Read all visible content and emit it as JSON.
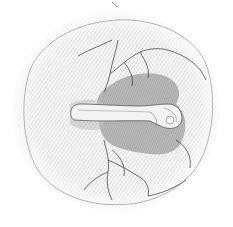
{
  "image": {
    "kind": "engraved scientific illustration",
    "subject": "embryo lying on a circular etched disc with branching vessels",
    "caption": "",
    "colors": {
      "paper": "#ffffff",
      "hatch_light": "#cfcfcf",
      "hatch_mid": "#b5b5b5",
      "shield_dark": "#9a9a9a",
      "vessel_line": "#4a4a4a",
      "embryo_body": "#f1f1f1",
      "embryo_outline": "#5a5a5a"
    },
    "regions": [
      {
        "name": "outer-disc",
        "shape": "circle",
        "cx": 116,
        "cy": 111,
        "r": 103
      },
      {
        "name": "dark-shield",
        "shape": "lobed",
        "center": [
          125,
          118
        ]
      },
      {
        "name": "embryo",
        "shape": "elongated",
        "from": [
          68,
          112
        ],
        "to": [
          182,
          120
        ],
        "head": "right"
      },
      {
        "name": "vessels-upper",
        "shape": "branching lines",
        "origin": [
          110,
          80
        ]
      },
      {
        "name": "vessels-lower",
        "shape": "branching lines",
        "origin": [
          105,
          145
        ]
      }
    ]
  }
}
